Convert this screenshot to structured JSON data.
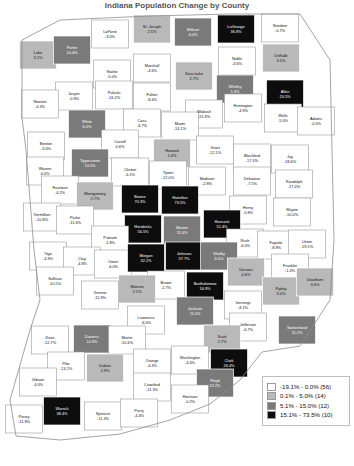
{
  "title": "Indiana Population Change by County",
  "legend": {
    "name": "map-legend",
    "items": [
      {
        "range": "-19.1% - 0.0%",
        "count": "(56)",
        "label": "-19.1% - 0.0% (56)",
        "color": "#ffffff",
        "class": "c0"
      },
      {
        "range": "0.1% - 5.0%",
        "count": "(14)",
        "label": "0.1% - 5.0% (14)",
        "color": "#b9b9b9",
        "class": "c1"
      },
      {
        "range": "5.1% - 15.0%",
        "count": "(12)",
        "label": "5.1% - 15.0% (12)",
        "color": "#7a7a7a",
        "class": "c2"
      },
      {
        "range": "15.1% - 73.5%",
        "count": "(10)",
        "label": "15.1% - 73.5% (10)",
        "color": "#0d0d0d",
        "class": "c3"
      }
    ]
  },
  "chart_data": {
    "type": "map",
    "title": "Indiana Population Change by County",
    "units": "percent",
    "classes": [
      {
        "min": -19.1,
        "max": 0.0,
        "count": 56,
        "color": "#ffffff"
      },
      {
        "min": 0.1,
        "max": 5.0,
        "count": 14,
        "color": "#b9b9b9"
      },
      {
        "min": 5.1,
        "max": 15.0,
        "count": 12,
        "color": "#7a7a7a"
      },
      {
        "min": 15.1,
        "max": 73.5,
        "count": 10,
        "color": "#0d0d0d"
      }
    ],
    "regions": [
      {
        "name": "Lake",
        "value": "3.2%",
        "num": 3.2,
        "cls": "c1",
        "x": 38,
        "y": 55
      },
      {
        "name": "Porter",
        "value": "10.4%",
        "num": 10.4,
        "cls": "c2",
        "x": 72,
        "y": 50
      },
      {
        "name": "LaPorte",
        "value": "-3.0%",
        "num": -3.0,
        "cls": "c0",
        "x": 110,
        "y": 34
      },
      {
        "name": "St. Joseph",
        "value": "2.5%",
        "num": 2.5,
        "cls": "c1",
        "x": 152,
        "y": 29
      },
      {
        "name": "Elkhart",
        "value": "6.0%",
        "num": 6.0,
        "cls": "c2",
        "x": 193,
        "y": 32
      },
      {
        "name": "LaGrange",
        "value": "36.8%",
        "num": 36.8,
        "cls": "c3",
        "x": 236,
        "y": 29
      },
      {
        "name": "Steuben",
        "value": "-0.7%",
        "num": -0.7,
        "cls": "c0",
        "x": 280,
        "y": 28
      },
      {
        "name": "Noble",
        "value": "-3.6%",
        "num": -3.6,
        "cls": "c0",
        "x": 237,
        "y": 61
      },
      {
        "name": "DeKalb",
        "value": "3.5%",
        "num": 3.5,
        "cls": "c1",
        "x": 281,
        "y": 58
      },
      {
        "name": "Marshall",
        "value": "-4.6%",
        "num": -4.6,
        "cls": "c0",
        "x": 152,
        "y": 68
      },
      {
        "name": "Starke",
        "value": "-5.0%",
        "num": -5.0,
        "cls": "c0",
        "x": 112,
        "y": 74
      },
      {
        "name": "Kosciusko",
        "value": "2.7%",
        "num": 2.7,
        "cls": "c1",
        "x": 194,
        "y": 76
      },
      {
        "name": "Whitley",
        "value": "5.3%",
        "num": 5.3,
        "cls": "c2",
        "x": 235,
        "y": 89
      },
      {
        "name": "Allen",
        "value": "20.5%",
        "num": 20.5,
        "cls": "c3",
        "x": 285,
        "y": 94
      },
      {
        "name": "Jasper",
        "value": "-0.9%",
        "num": -0.9,
        "cls": "c0",
        "x": 74,
        "y": 96
      },
      {
        "name": "Pulaski",
        "value": "-16.2%",
        "num": -16.2,
        "cls": "c0",
        "x": 114,
        "y": 95
      },
      {
        "name": "Fulton",
        "value": "-8.4%",
        "num": -8.4,
        "cls": "c0",
        "x": 152,
        "y": 97
      },
      {
        "name": "Newton",
        "value": "-4.3%",
        "num": -4.3,
        "cls": "c0",
        "x": 40,
        "y": 104
      },
      {
        "name": "Wabash",
        "value": "-15.9%",
        "num": -15.9,
        "cls": "c0",
        "x": 204,
        "y": 114
      },
      {
        "name": "Huntington",
        "value": "-4.9%",
        "num": -4.9,
        "cls": "c0",
        "x": 243,
        "y": 108
      },
      {
        "name": "Wells",
        "value": "-5.0%",
        "num": -5.0,
        "cls": "c0",
        "x": 283,
        "y": 118
      },
      {
        "name": "Adams",
        "value": "-0.5%",
        "num": -0.5,
        "cls": "c0",
        "x": 316,
        "y": 121
      },
      {
        "name": "White",
        "value": "6.0%",
        "num": 6.0,
        "cls": "c2",
        "x": 87,
        "y": 124
      },
      {
        "name": "Cass",
        "value": "-6.7%",
        "num": -6.7,
        "cls": "c0",
        "x": 142,
        "y": 123
      },
      {
        "name": "Miami",
        "value": "-14.1%",
        "num": -14.1,
        "cls": "c0",
        "x": 180,
        "y": 126
      },
      {
        "name": "Benton",
        "value": "-3.0%",
        "num": -3.0,
        "cls": "c0",
        "x": 46,
        "y": 146
      },
      {
        "name": "Carroll",
        "value": "0.6%",
        "num": 0.6,
        "cls": "c0",
        "x": 120,
        "y": 144
      },
      {
        "name": "Howard",
        "value": "1.0%",
        "num": 1.0,
        "cls": "c1",
        "x": 172,
        "y": 153
      },
      {
        "name": "Grant",
        "value": "-12.1%",
        "num": -12.1,
        "cls": "c0",
        "x": 215,
        "y": 150
      },
      {
        "name": "Blackford",
        "value": "-17.3%",
        "num": -17.3,
        "cls": "c0",
        "x": 252,
        "y": 158
      },
      {
        "name": "Jay",
        "value": "-18.6%",
        "num": -18.6,
        "cls": "c0",
        "x": 290,
        "y": 159
      },
      {
        "name": "Tippecanoe",
        "value": "14.5%",
        "num": 14.5,
        "cls": "c2",
        "x": 90,
        "y": 163
      },
      {
        "name": "Warren",
        "value": "4.0%",
        "num": 4.0,
        "cls": "c0",
        "x": 45,
        "y": 171
      },
      {
        "name": "Clinton",
        "value": "-6.1%",
        "num": -6.1,
        "cls": "c0",
        "x": 130,
        "y": 172
      },
      {
        "name": "Tipton",
        "value": "-12.0%",
        "num": -12.0,
        "cls": "c0",
        "x": 168,
        "y": 175
      },
      {
        "name": "Madison",
        "value": "-2.8%",
        "num": -2.8,
        "cls": "c0",
        "x": 207,
        "y": 181
      },
      {
        "name": "Delaware",
        "value": "-7.5%",
        "num": -7.5,
        "cls": "c0",
        "x": 252,
        "y": 181
      },
      {
        "name": "Randolph",
        "value": "-17.4%",
        "num": -17.4,
        "cls": "c0",
        "x": 294,
        "y": 184
      },
      {
        "name": "Fountain",
        "value": "-4.2%",
        "num": -4.2,
        "cls": "c0",
        "x": 60,
        "y": 190
      },
      {
        "name": "Montgomery",
        "value": "2.7%",
        "num": 2.7,
        "cls": "c1",
        "x": 95,
        "y": 196
      },
      {
        "name": "Boone",
        "value": "70.3%",
        "num": 70.3,
        "cls": "c3",
        "x": 140,
        "y": 199
      },
      {
        "name": "Hamilton",
        "value": "73.5%",
        "num": 73.5,
        "cls": "c3",
        "x": 180,
        "y": 200
      },
      {
        "name": "Henry",
        "value": "-5.8%",
        "num": -5.8,
        "cls": "c0",
        "x": 248,
        "y": 210
      },
      {
        "name": "Wayne",
        "value": "-10.0%",
        "num": -10.0,
        "cls": "c0",
        "x": 292,
        "y": 212
      },
      {
        "name": "Vermillion",
        "value": "-10.8%",
        "num": -10.8,
        "cls": "c0",
        "x": 42,
        "y": 217
      },
      {
        "name": "Parke",
        "value": "-11.6%",
        "num": -11.6,
        "cls": "c0",
        "x": 75,
        "y": 220
      },
      {
        "name": "Hendricks",
        "value": "56.5%",
        "num": 56.5,
        "cls": "c3",
        "x": 143,
        "y": 229
      },
      {
        "name": "Marion",
        "value": "11.0%",
        "num": 11.0,
        "cls": "c2",
        "x": 182,
        "y": 230
      },
      {
        "name": "Hancock",
        "value": "51.4%",
        "num": 51.4,
        "cls": "c3",
        "x": 222,
        "y": 224
      },
      {
        "name": "Putnam",
        "value": "-1.8%",
        "num": -1.8,
        "cls": "c0",
        "x": 110,
        "y": 240
      },
      {
        "name": "Rush",
        "value": "-6.0%",
        "num": -6.0,
        "cls": "c0",
        "x": 245,
        "y": 243
      },
      {
        "name": "Fayette",
        "value": "-8.9%",
        "num": -8.9,
        "cls": "c0",
        "x": 276,
        "y": 245
      },
      {
        "name": "Union",
        "value": "-19.1%",
        "num": -19.1,
        "cls": "c0",
        "x": 307,
        "y": 244
      },
      {
        "name": "Vigo",
        "value": "-4.9%",
        "num": -4.9,
        "cls": "c0",
        "x": 48,
        "y": 256
      },
      {
        "name": "Clay",
        "value": "-4.8%",
        "num": -4.8,
        "cls": "c0",
        "x": 82,
        "y": 261
      },
      {
        "name": "Owen",
        "value": "-6.0%",
        "num": -6.0,
        "cls": "c0",
        "x": 113,
        "y": 264
      },
      {
        "name": "Morgan",
        "value": "32.2%",
        "num": 32.2,
        "cls": "c3",
        "x": 146,
        "y": 258
      },
      {
        "name": "Johnson",
        "value": "37.7%",
        "num": 37.7,
        "cls": "c3",
        "x": 184,
        "y": 256
      },
      {
        "name": "Shelby",
        "value": "6.5%",
        "num": 6.5,
        "cls": "c2",
        "x": 219,
        "y": 256
      },
      {
        "name": "Decatur",
        "value": "0.6%",
        "num": 0.6,
        "cls": "c1",
        "x": 246,
        "y": 272
      },
      {
        "name": "Franklin",
        "value": "-1.4%",
        "num": -1.4,
        "cls": "c0",
        "x": 290,
        "y": 268
      },
      {
        "name": "Brown",
        "value": "-2.7%",
        "num": -2.7,
        "cls": "c0",
        "x": 166,
        "y": 285
      },
      {
        "name": "Bartholomew",
        "value": "16.9%",
        "num": 16.9,
        "cls": "c3",
        "x": 205,
        "y": 286
      },
      {
        "name": "Monroe",
        "value": "2.1%",
        "num": 2.1,
        "cls": "c1",
        "x": 137,
        "y": 289
      },
      {
        "name": "Ripley",
        "value": "3.0%",
        "num": 3.0,
        "cls": "c1",
        "x": 281,
        "y": 291
      },
      {
        "name": "Dearborn",
        "value": "3.0%",
        "num": 3.0,
        "cls": "c1",
        "x": 315,
        "y": 282
      },
      {
        "name": "Sullivan",
        "value": "-10.5%",
        "num": -10.5,
        "cls": "c0",
        "x": 55,
        "y": 281
      },
      {
        "name": "Greene",
        "value": "-11.9%",
        "num": -11.9,
        "cls": "c0",
        "x": 100,
        "y": 295
      },
      {
        "name": "Jennings",
        "value": "-8.1%",
        "num": -8.1,
        "cls": "c0",
        "x": 243,
        "y": 305
      },
      {
        "name": "Jackson",
        "value": "11.0%",
        "num": 11.0,
        "cls": "c2",
        "x": 195,
        "y": 311
      },
      {
        "name": "Lawrence",
        "value": "-6.0%",
        "num": -6.0,
        "cls": "c0",
        "x": 146,
        "y": 320
      },
      {
        "name": "Jefferson",
        "value": "-6.7%",
        "num": -6.7,
        "cls": "c0",
        "x": 248,
        "y": 327
      },
      {
        "name": "Switzerland",
        "value": "11.1%",
        "num": 11.1,
        "cls": "c2",
        "x": 297,
        "y": 330
      },
      {
        "name": "Knox",
        "value": "-12.7%",
        "num": -12.7,
        "cls": "c0",
        "x": 50,
        "y": 340
      },
      {
        "name": "Daviess",
        "value": "10.9%",
        "num": 10.9,
        "cls": "c2",
        "x": 92,
        "y": 339
      },
      {
        "name": "Martin",
        "value": "-10.6%",
        "num": -10.6,
        "cls": "c0",
        "x": 127,
        "y": 340
      },
      {
        "name": "Scott",
        "value": "2.7%",
        "num": 2.7,
        "cls": "c1",
        "x": 222,
        "y": 339
      },
      {
        "name": "Orange",
        "value": "-4.3%",
        "num": -4.3,
        "cls": "c0",
        "x": 152,
        "y": 363
      },
      {
        "name": "Washington",
        "value": "-4.4%",
        "num": -4.4,
        "cls": "c0",
        "x": 190,
        "y": 360
      },
      {
        "name": "Clark",
        "value": "26.4%",
        "num": 26.4,
        "cls": "c3",
        "x": 229,
        "y": 363
      },
      {
        "name": "Pike",
        "value": "-13.2%",
        "num": -13.2,
        "cls": "c0",
        "x": 66,
        "y": 366
      },
      {
        "name": "Dubois",
        "value": "2.9%",
        "num": 2.9,
        "cls": "c1",
        "x": 105,
        "y": 368
      },
      {
        "name": "Crawford",
        "value": "-11.3%",
        "num": -11.3,
        "cls": "c0",
        "x": 152,
        "y": 387
      },
      {
        "name": "Floyd",
        "value": "12.2%",
        "num": 12.2,
        "cls": "c2",
        "x": 215,
        "y": 383
      },
      {
        "name": "Gibson",
        "value": "-4.0%",
        "num": -4.0,
        "cls": "c0",
        "x": 38,
        "y": 382
      },
      {
        "name": "Harrison",
        "value": "-0.2%",
        "num": -0.2,
        "cls": "c0",
        "x": 190,
        "y": 399
      },
      {
        "name": "Warrick",
        "value": "38.4%",
        "num": 38.4,
        "cls": "c3",
        "x": 62,
        "y": 411
      },
      {
        "name": "Spencer",
        "value": "-11.3%",
        "num": -11.3,
        "cls": "c0",
        "x": 103,
        "y": 416
      },
      {
        "name": "Perry",
        "value": "-4.4%",
        "num": -4.4,
        "cls": "c0",
        "x": 139,
        "y": 413
      },
      {
        "name": "Posey",
        "value": "-11.9%",
        "num": -11.9,
        "cls": "c0",
        "x": 24,
        "y": 419
      }
    ]
  }
}
